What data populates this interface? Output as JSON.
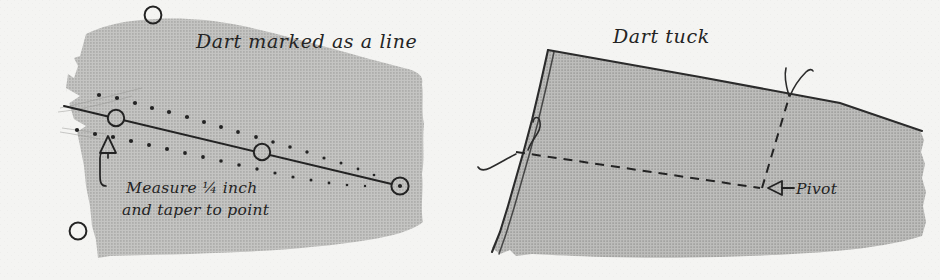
{
  "figure": {
    "kind": "sewing-instruction-illustration",
    "medium": "halftone line drawing on paper",
    "panels": [
      {
        "id": "left",
        "title": "Dart marked as a line",
        "annotation_line_1": "Measure ¼ inch",
        "annotation_line_2": "and taper to point",
        "marks": [
          "notch-upper",
          "notch-lower",
          "circle-on-dart-line-near-edge",
          "circle-on-dart-line-middle",
          "circle-with-center-dot-at-dart-point",
          "circle-top-edge-partial",
          "circle-lower-left",
          "tailors-tack-dot-row-upper",
          "tailors-tack-dot-row-lower",
          "arrowhead-pointing-up"
        ]
      },
      {
        "id": "right",
        "title": "Dart tuck",
        "pivot_label": "Pivot",
        "marks": [
          "folded-edge-double-line",
          "thread-tail-at-fold",
          "thread-tail-at-pivot-top",
          "dashed-stitching-line-horizontal",
          "dashed-stitching-line-vertical",
          "pivot-arrow-pointing-left"
        ]
      }
    ]
  },
  "colors": {
    "paper": "#f4f4f2",
    "fabric": "#bcbcba",
    "fabric_shade": "#b2b2b0",
    "ink": "#242424",
    "ink_soft": "#3a3a3a"
  }
}
